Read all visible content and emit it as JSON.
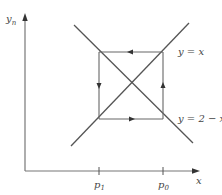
{
  "figure": {
    "type": "cobweb-diagram",
    "axes": {
      "y_label": "y",
      "y_label_sub": "n",
      "x_label": "x",
      "x_ticks": [
        {
          "label": "p",
          "sub": "1"
        },
        {
          "label": "p",
          "sub": "0"
        }
      ]
    },
    "curves": [
      {
        "name": "identity-line",
        "label": "y = x"
      },
      {
        "name": "reflection-line",
        "label": "y = 2 − x"
      }
    ],
    "cycle": {
      "description": "2-cycle orbit between p0 and p1",
      "edges": [
        {
          "edge": "top",
          "direction": "left"
        },
        {
          "edge": "left",
          "direction": "down"
        },
        {
          "edge": "bottom",
          "direction": "right"
        },
        {
          "edge": "right",
          "direction": "up"
        }
      ]
    },
    "colors": {
      "line": "#555555",
      "axis": "#777777",
      "text": "#444444"
    }
  }
}
